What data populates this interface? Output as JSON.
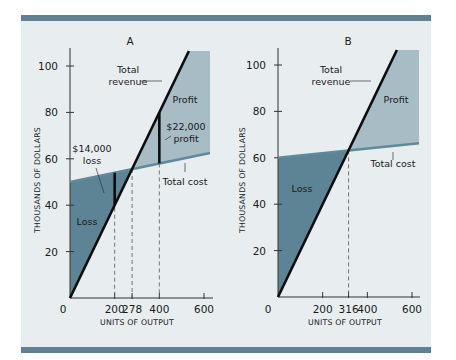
{
  "colors": {
    "frame_rule": "#5f8191",
    "background": "#e8eef0",
    "loss_fill": "#5c8494",
    "profit_fill": "#a8bcc6",
    "revenue_line": "#0d0d0d",
    "cost_line": "#5f8a99",
    "guide_line": "#555555"
  },
  "chart_data": [
    {
      "type": "line",
      "title": "A",
      "xlabel": "UNITS OF OUTPUT",
      "ylabel": "THOUSANDS OF DOLLARS",
      "xlim": [
        0,
        600
      ],
      "ylim": [
        0,
        100
      ],
      "x_ticks": [
        0,
        200,
        278,
        400,
        600
      ],
      "y_ticks": [
        20,
        40,
        60,
        80,
        100
      ],
      "series": [
        {
          "name": "Total revenue",
          "x": [
            0,
            525
          ],
          "y": [
            0,
            105
          ]
        },
        {
          "name": "Total cost",
          "x": [
            0,
            600
          ],
          "y": [
            50,
            62
          ]
        }
      ],
      "regions": [
        {
          "name": "Loss",
          "label": "Loss"
        },
        {
          "name": "Profit",
          "label": "Profit"
        }
      ],
      "break_even": 278,
      "annotations": [
        {
          "text_line1": "$14,000",
          "text_line2": "loss",
          "x": 200,
          "y_from": 40,
          "y_to": 54
        },
        {
          "text_line1": "$22,000",
          "text_line2": "profit",
          "x": 400,
          "y_from": 58,
          "y_to": 80
        }
      ],
      "line_labels": {
        "revenue_line1": "Total",
        "revenue_line2": "revenue",
        "cost": "Total cost"
      }
    },
    {
      "type": "line",
      "title": "B",
      "xlabel": "UNITS OF OUTPUT",
      "ylabel": "THOUSANDS OF DOLLARS",
      "xlim": [
        0,
        600
      ],
      "ylim": [
        0,
        100
      ],
      "x_ticks": [
        0,
        200,
        316,
        400,
        600
      ],
      "y_ticks": [
        20,
        40,
        60,
        80,
        100
      ],
      "series": [
        {
          "name": "Total revenue",
          "x": [
            0,
            525
          ],
          "y": [
            0,
            105
          ]
        },
        {
          "name": "Total cost",
          "x": [
            0,
            600
          ],
          "y": [
            60,
            66
          ]
        }
      ],
      "regions": [
        {
          "name": "Loss",
          "label": "Loss"
        },
        {
          "name": "Profit",
          "label": "Profit"
        }
      ],
      "break_even": 316,
      "annotations": [],
      "line_labels": {
        "revenue_line1": "Total",
        "revenue_line2": "revenue",
        "cost": "Total cost"
      }
    }
  ]
}
